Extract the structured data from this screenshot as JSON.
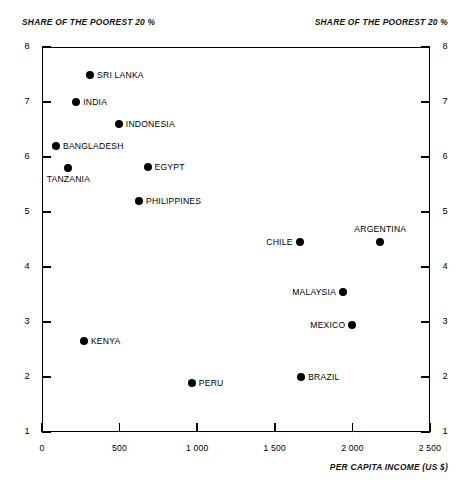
{
  "header": {
    "left_caption": "SHARE OF THE POOREST 20 %",
    "right_caption": "SHARE OF THE POOREST 20 %"
  },
  "axes": {
    "x_title": "PER CAPITA INCOME (US $)",
    "x_ticks": [
      "0",
      "500",
      "1 000",
      "1 500",
      "2 000",
      "2 500"
    ],
    "y_ticks_left": [
      "8",
      "7",
      "6",
      "5",
      "4",
      "3",
      "2",
      "1"
    ],
    "y_ticks_right": [
      "8",
      "7",
      "6",
      "5",
      "4",
      "3",
      "2",
      "1"
    ]
  },
  "chart_data": {
    "type": "scatter",
    "title": "",
    "xlabel": "PER CAPITA INCOME (US $)",
    "ylabel": "SHARE OF THE POOREST 20 %",
    "xlim": [
      0,
      2500
    ],
    "ylim": [
      1,
      8
    ],
    "xticks": [
      0,
      500,
      1000,
      1500,
      2000,
      2500
    ],
    "xticklabels": [
      "0",
      "500",
      "1 000",
      "1 500",
      "2 000",
      "2 500"
    ],
    "yticks": [
      1,
      2,
      3,
      4,
      5,
      6,
      7,
      8
    ],
    "grid": false,
    "legend": false,
    "marker": "filled-circle",
    "marker_color": "#000000",
    "points": [
      {
        "label": "SRI LANKA",
        "x": 310,
        "y": 7.5,
        "label_pos": "right"
      },
      {
        "label": "INDIA",
        "x": 220,
        "y": 7.0,
        "label_pos": "right"
      },
      {
        "label": "INDONESIA",
        "x": 495,
        "y": 6.6,
        "label_pos": "right"
      },
      {
        "label": "BANGLADESH",
        "x": 90,
        "y": 6.2,
        "label_pos": "right"
      },
      {
        "label": "TANZANIA",
        "x": 170,
        "y": 5.8,
        "label_pos": "below"
      },
      {
        "label": "EGYPT",
        "x": 680,
        "y": 5.82,
        "label_pos": "right"
      },
      {
        "label": "PHILIPPINES",
        "x": 625,
        "y": 5.2,
        "label_pos": "right"
      },
      {
        "label": "ARGENTINA",
        "x": 2180,
        "y": 4.45,
        "label_pos": "above"
      },
      {
        "label": "CHILE",
        "x": 1660,
        "y": 4.45,
        "label_pos": "left"
      },
      {
        "label": "MALAYSIA",
        "x": 1940,
        "y": 3.55,
        "label_pos": "left"
      },
      {
        "label": "MEXICO",
        "x": 2000,
        "y": 2.95,
        "label_pos": "left"
      },
      {
        "label": "KENYA",
        "x": 270,
        "y": 2.65,
        "label_pos": "right"
      },
      {
        "label": "BRAZIL",
        "x": 1670,
        "y": 2.0,
        "label_pos": "right"
      },
      {
        "label": "PERU",
        "x": 965,
        "y": 1.9,
        "label_pos": "right"
      }
    ]
  }
}
